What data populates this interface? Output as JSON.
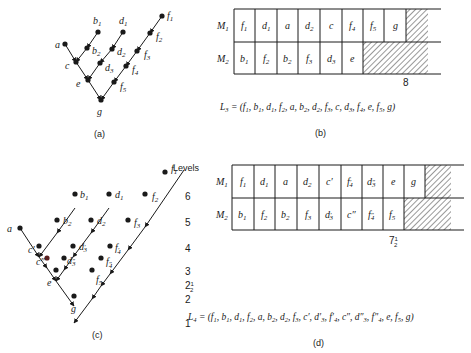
{
  "panels": {
    "a": {
      "caption": "(a)",
      "nodes": [
        {
          "id": "f1",
          "label": "f",
          "sub": "1",
          "x": 162,
          "y": 16
        },
        {
          "id": "f2",
          "label": "f",
          "sub": "2",
          "x": 150,
          "y": 33
        },
        {
          "id": "f3",
          "label": "f",
          "sub": "3",
          "x": 137,
          "y": 51
        },
        {
          "id": "f4",
          "label": "f",
          "sub": "4",
          "x": 126,
          "y": 66
        },
        {
          "id": "f5",
          "label": "f",
          "sub": "5",
          "x": 114,
          "y": 82
        },
        {
          "id": "b1",
          "label": "b",
          "sub": "1",
          "x": 98,
          "y": 32
        },
        {
          "id": "b2",
          "label": "b",
          "sub": "2",
          "x": 87,
          "y": 48
        },
        {
          "id": "d1",
          "label": "d",
          "sub": "1",
          "x": 123,
          "y": 32
        },
        {
          "id": "d2",
          "label": "d",
          "sub": "2",
          "x": 112,
          "y": 49
        },
        {
          "id": "d3",
          "label": "d",
          "sub": "3",
          "x": 100,
          "y": 63
        },
        {
          "id": "a",
          "label": "a",
          "sub": "",
          "x": 65,
          "y": 44
        },
        {
          "id": "c",
          "label": "c",
          "sub": "",
          "x": 76,
          "y": 62
        },
        {
          "id": "e",
          "label": "e",
          "sub": "",
          "x": 88,
          "y": 80
        },
        {
          "id": "g",
          "label": "g",
          "sub": "",
          "x": 101,
          "y": 100
        }
      ]
    },
    "b": {
      "caption": "(b)",
      "rows": [
        {
          "label": "M",
          "sub": "1",
          "cells": [
            "f1",
            "d1",
            "a",
            "d2",
            "c",
            "f4",
            "f5",
            "g"
          ]
        },
        {
          "label": "M",
          "sub": "2",
          "cells": [
            "b1",
            "f2",
            "b2",
            "f3",
            "d3",
            "e"
          ]
        }
      ],
      "end_marker": "8",
      "list_name": "L",
      "list_sub": "3",
      "list": [
        "f1",
        "b1",
        "d1",
        "f2",
        "a",
        "b2",
        "d2",
        "f3",
        "c",
        "d3",
        "f4",
        "e",
        "f5",
        "g"
      ]
    },
    "c": {
      "caption": "(c)",
      "levels_title": "Levels",
      "levels": [
        "6",
        "5",
        "4",
        "3",
        "2½",
        "2",
        "1"
      ]
    },
    "d": {
      "caption": "(d)",
      "rows": [
        {
          "label": "M",
          "sub": "1",
          "cells": [
            "f1",
            "d1",
            "a",
            "d2",
            "c′",
            "f′4",
            "d″3",
            "e",
            "g"
          ]
        },
        {
          "label": "M",
          "sub": "2",
          "cells": [
            "b1",
            "f2",
            "b2",
            "f3",
            "d′3",
            "c″",
            "f″4",
            "f5"
          ]
        }
      ],
      "end_marker": "7½",
      "list_name": "L",
      "list_sub": "4",
      "list": [
        "f1",
        "b1",
        "d1",
        "f2",
        "a",
        "b2",
        "d2",
        "f3",
        "c′",
        "d′3",
        "f′4",
        "c″",
        "d″3",
        "f″4",
        "e",
        "f5",
        "g"
      ]
    }
  },
  "colors": {
    "ink": "#1a1a1a",
    "hatch": "#333333",
    "background": "#ffffff"
  }
}
